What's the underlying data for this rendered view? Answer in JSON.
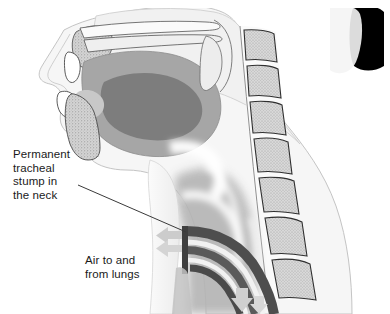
{
  "figure": {
    "type": "medical-illustration",
    "view": "mid-sagittal",
    "width": 390,
    "height": 314,
    "background_color": "#ffffff"
  },
  "labels": {
    "stump": {
      "text": "Permanent\ntracheal\nstump in\nthe neck",
      "lines": [
        "Permanent",
        "tracheal",
        "stump in",
        "the neck"
      ],
      "x": 13,
      "y": 148,
      "color": "#1a1a1a",
      "font_size_px": 11.5
    },
    "air": {
      "text": "Air to and\nfrom lungs",
      "lines": [
        "Air to and",
        "from lungs"
      ],
      "x": 85,
      "y": 254,
      "color": "#1a1a1a",
      "font_size_px": 11.5
    }
  },
  "leader_line": {
    "from_x": 78,
    "from_y": 185,
    "to_x": 186,
    "to_y": 232,
    "color": "#3a3a3a",
    "width_px": 1
  },
  "airflow_arrows": [
    {
      "name": "stoma-arrow-upper",
      "direction": "left",
      "x": 168,
      "y": 234,
      "color": "#c9c9c9"
    },
    {
      "name": "stoma-arrow-lower",
      "direction": "left",
      "x": 168,
      "y": 247,
      "color": "#c9c9c9"
    },
    {
      "name": "lung-arrow-outer",
      "direction": "down",
      "x": 240,
      "y": 296,
      "color": "#c9c9c9"
    },
    {
      "name": "lung-arrow-inner",
      "direction": "down",
      "x": 258,
      "y": 300,
      "color": "#c9c9c9"
    }
  ],
  "palette": {
    "skin_outline": "#b9b9b9",
    "skin_fill": "#f3f3f3",
    "soft_tissue_light": "#e9e9e9",
    "soft_tissue_mid": "#c6c6c6",
    "mucosa": "#a8a8a8",
    "tongue": "#8f8f8f",
    "tongue_core": "#6f6f6f",
    "bone_stipple": "#cfcfcf",
    "bone_outline": "#4a4a4a",
    "vertebra_fill": "#d2d2d2",
    "trachea_wall": "#585858",
    "trachea_wall_dark": "#4a4a4a",
    "trachea_lumen": "#efefef",
    "hair_black": "#000000",
    "line": "#3a3a3a"
  },
  "structures": [
    {
      "name": "nasal-cavity",
      "label": "Nasal cavity"
    },
    {
      "name": "hard-palate",
      "label": "Hard palate"
    },
    {
      "name": "soft-palate",
      "label": "Soft palate"
    },
    {
      "name": "tongue",
      "label": "Tongue"
    },
    {
      "name": "upper-lip",
      "label": "Upper lip"
    },
    {
      "name": "lower-lip",
      "label": "Lower lip"
    },
    {
      "name": "upper-incisor",
      "label": "Upper incisor"
    },
    {
      "name": "lower-incisor",
      "label": "Lower incisor"
    },
    {
      "name": "mandible",
      "label": "Mandible"
    },
    {
      "name": "pharynx",
      "label": "Pharynx"
    },
    {
      "name": "esophagus",
      "label": "Esophagus"
    },
    {
      "name": "cervical-vertebrae",
      "label": "Cervical vertebrae"
    },
    {
      "name": "tracheal-stump",
      "label": "Permanent tracheal stump"
    },
    {
      "name": "stoma",
      "label": "Tracheostoma"
    },
    {
      "name": "hair",
      "label": "Hair"
    }
  ]
}
